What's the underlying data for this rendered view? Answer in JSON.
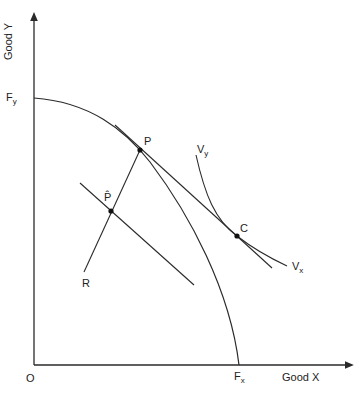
{
  "diagram": {
    "axes": {
      "y_label": "Good Y",
      "x_label": "Good X",
      "origin": "O"
    },
    "points": {
      "Fy": {
        "main": "F",
        "sub": "y"
      },
      "Fx": {
        "main": "F",
        "sub": "x"
      },
      "P": "P",
      "P_hat": "P̂",
      "C": "C",
      "R": "R",
      "Vy": {
        "main": "V",
        "sub": "y"
      },
      "Vx": {
        "main": "V",
        "sub": "x"
      }
    },
    "colors": {
      "line": "#2a2a2a",
      "background": "#ffffff"
    }
  }
}
